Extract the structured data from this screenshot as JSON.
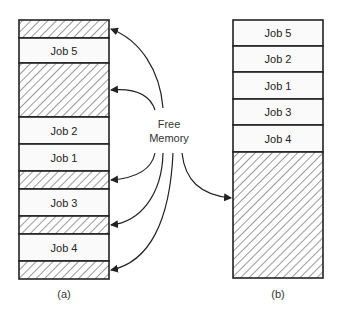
{
  "diagram": {
    "colors": {
      "stroke": "#222222",
      "fill": "#fafafa",
      "hatch": "#555555"
    },
    "left_column": {
      "caption": "(a)",
      "x": 19,
      "width": 90,
      "blocks": [
        {
          "type": "free",
          "y": 20,
          "h": 18,
          "label": ""
        },
        {
          "type": "job",
          "y": 38,
          "h": 25,
          "label": "Job 5"
        },
        {
          "type": "free",
          "y": 63,
          "h": 54,
          "label": ""
        },
        {
          "type": "job",
          "y": 117,
          "h": 27,
          "label": "Job 2"
        },
        {
          "type": "job",
          "y": 144,
          "h": 27,
          "label": "Job 1"
        },
        {
          "type": "free",
          "y": 171,
          "h": 18,
          "label": ""
        },
        {
          "type": "job",
          "y": 189,
          "h": 27,
          "label": "Job 3"
        },
        {
          "type": "free",
          "y": 216,
          "h": 18,
          "label": ""
        },
        {
          "type": "job",
          "y": 234,
          "h": 27,
          "label": "Job 4"
        },
        {
          "type": "free",
          "y": 261,
          "h": 18,
          "label": ""
        }
      ]
    },
    "right_column": {
      "caption": "(b)",
      "x": 233,
      "width": 90,
      "blocks": [
        {
          "type": "job",
          "y": 20,
          "h": 26,
          "label": "Job 5"
        },
        {
          "type": "job",
          "y": 46,
          "h": 26,
          "label": "Job 2"
        },
        {
          "type": "job",
          "y": 72,
          "h": 27,
          "label": "Job 1"
        },
        {
          "type": "job",
          "y": 99,
          "h": 26,
          "label": "Job 3"
        },
        {
          "type": "job",
          "y": 125,
          "h": 27,
          "label": "Job 4"
        },
        {
          "type": "free",
          "y": 152,
          "h": 126,
          "label": ""
        }
      ]
    },
    "free_memory_label": {
      "line1": "Free",
      "line2": "Memory"
    },
    "arrows": [
      {
        "target": "left-free-1",
        "d": "M163,108 C160,70 140,40 111,29"
      },
      {
        "target": "left-free-2",
        "d": "M155,110 C150,95 135,88 111,90"
      },
      {
        "target": "left-free-3",
        "d": "M155,153 C152,168 138,178 111,180"
      },
      {
        "target": "left-free-4",
        "d": "M163,153 C162,195 140,222 111,225"
      },
      {
        "target": "left-free-5",
        "d": "M173,153 C170,220 150,262 111,270"
      },
      {
        "target": "right-free",
        "d": "M182,153 C185,180 200,195 231,198"
      }
    ]
  }
}
